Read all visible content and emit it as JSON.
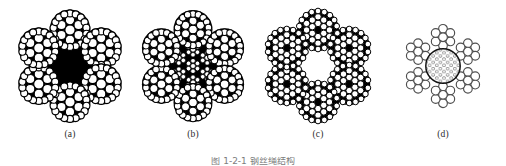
{
  "figure": {
    "background_color": "#ffffff",
    "ink_color": "#000000",
    "label_color": "#2b2b2b",
    "caption_color": "#7d7d7d",
    "caption_text": "图 1-2-1  钢丝绳结构",
    "caption_clipped": "true",
    "panels": [
      {
        "id": "a",
        "label": "(a)",
        "name": "wire-rope-cross-section-a",
        "description": "six outer strands around a solid dark core",
        "strand_count": 6,
        "core_style": "solid-black",
        "wire_fill": "#ffffff",
        "wire_stroke": "#000000",
        "gap_fill": "#000000"
      },
      {
        "id": "b",
        "label": "(b)",
        "name": "wire-rope-cross-section-b",
        "description": "six outer strands around an independent wire rope core",
        "strand_count": 6,
        "core_style": "independent-wire-rope-core",
        "wire_fill": "#ffffff",
        "wire_stroke": "#000000",
        "gap_fill": "#000000"
      },
      {
        "id": "c",
        "label": "(c)",
        "name": "wire-rope-cross-section-c",
        "description": "six compact strands with small dark strand centers",
        "strand_count": 6,
        "core_style": "small-dark-centers",
        "wire_fill": "#ffffff",
        "wire_stroke": "#000000",
        "gap_fill": "#000000"
      },
      {
        "id": "d",
        "label": "(d)",
        "name": "wire-rope-cross-section-d",
        "description": "outline wires in hexagonal packing around a hatched fiber core",
        "strand_count": 6,
        "core_style": "fiber-core-circle",
        "wire_fill": "#ffffff",
        "wire_stroke": "#555555",
        "gap_fill": "#ffffff"
      }
    ]
  }
}
